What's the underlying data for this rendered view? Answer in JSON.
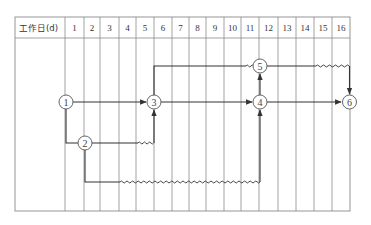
{
  "header": {
    "label": "工作日(d)",
    "days": [
      "1",
      "2",
      "3",
      "4",
      "5",
      "6",
      "7",
      "8",
      "9",
      "10",
      "11",
      "12",
      "13",
      "14",
      "15",
      "16"
    ]
  },
  "nodes": [
    {
      "id": "1",
      "label": "1",
      "day": 0,
      "row": "middle"
    },
    {
      "id": "2",
      "label": "2",
      "day": 1,
      "row": "lower"
    },
    {
      "id": "3",
      "label": "3",
      "day": 5,
      "row": "middle"
    },
    {
      "id": "4",
      "label": "4",
      "day": 11,
      "row": "middle"
    },
    {
      "id": "5",
      "label": "5",
      "day": 11,
      "row": "upper"
    },
    {
      "id": "6",
      "label": "6",
      "day": 16,
      "row": "middle"
    }
  ],
  "activities": [
    {
      "from": "1",
      "to": "3",
      "type": "solid"
    },
    {
      "from": "1",
      "to": "2",
      "type": "solid"
    },
    {
      "from": "2",
      "to": "3",
      "type": "solid+free-float",
      "float_days": 1
    },
    {
      "from": "3",
      "to": "5",
      "type": "solid+free-float",
      "float_days": 0.5
    },
    {
      "from": "3",
      "to": "4",
      "type": "solid"
    },
    {
      "from": "2",
      "to": "4",
      "type": "solid+free-float",
      "float_days": 8
    },
    {
      "from": "4",
      "to": "5",
      "type": "virtual"
    },
    {
      "from": "4",
      "to": "6",
      "type": "solid"
    },
    {
      "from": "5",
      "to": "6",
      "type": "solid+free-float",
      "float_days": 2
    }
  ]
}
